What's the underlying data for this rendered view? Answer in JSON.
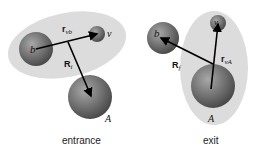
{
  "colors": {
    "background": "#ffffff",
    "ellipse": "#dcdcdc",
    "sphere_light": "#9a9a9a",
    "sphere_dark": "#4a4a4a",
    "arrow": "#000000"
  },
  "entrance": {
    "caption": "entrance",
    "particles": {
      "b": "b",
      "v": "v",
      "A": "A"
    },
    "vectors": {
      "r_vb": {
        "main": "r",
        "sub": "vb"
      },
      "R_i": {
        "main": "R",
        "sub": "i"
      }
    }
  },
  "exit": {
    "caption": "exit",
    "particles": {
      "b": "b",
      "v": "v",
      "A": "A"
    },
    "vectors": {
      "r_vA": {
        "main": "r",
        "sub": "vA"
      },
      "R_f": {
        "main": "R",
        "sub": "f"
      }
    }
  }
}
